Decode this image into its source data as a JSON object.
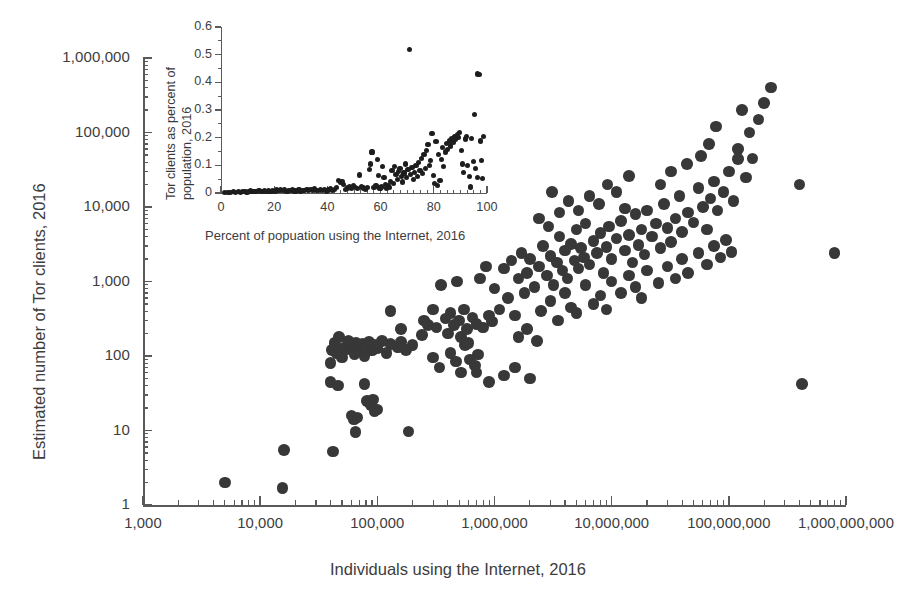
{
  "chart_data": {
    "type": "scatter",
    "title": "",
    "xlabel": "Individuals using the Internet, 2016",
    "ylabel": "Estimated number of Tor clients, 2016",
    "xscale": "log",
    "yscale": "log",
    "xlim": [
      1000,
      1000000000
    ],
    "ylim": [
      1,
      1000000
    ],
    "grid": false,
    "legend": "none",
    "x_tick_labels": [
      "1,000",
      "10,000",
      "100,000",
      "1,000,000",
      "10,000,000",
      "100,000,000",
      "1,000,000,000"
    ],
    "y_tick_labels": [
      "1",
      "10",
      "100",
      "1,000",
      "10,000",
      "100,000",
      "1,000,000"
    ],
    "marker_color": "#383838",
    "points": [
      [
        5000,
        2
      ],
      [
        15500,
        1.7
      ],
      [
        16000,
        5.5
      ],
      [
        42000,
        5.2
      ],
      [
        65000,
        9.5
      ],
      [
        185000,
        9.7
      ],
      [
        40000,
        80
      ],
      [
        41000,
        120
      ],
      [
        43000,
        150
      ],
      [
        45000,
        110
      ],
      [
        47000,
        180
      ],
      [
        50000,
        95
      ],
      [
        52000,
        130
      ],
      [
        55000,
        125
      ],
      [
        57000,
        160
      ],
      [
        60000,
        140
      ],
      [
        62000,
        120
      ],
      [
        64000,
        105
      ],
      [
        66000,
        150
      ],
      [
        70000,
        135
      ],
      [
        72000,
        115
      ],
      [
        75000,
        145
      ],
      [
        78000,
        100
      ],
      [
        80000,
        130
      ],
      [
        85000,
        155
      ],
      [
        90000,
        118
      ],
      [
        95000,
        140
      ],
      [
        100000,
        128
      ],
      [
        110000,
        160
      ],
      [
        120000,
        110
      ],
      [
        130000,
        145
      ],
      [
        150000,
        130
      ],
      [
        160000,
        155
      ],
      [
        175000,
        120
      ],
      [
        40000,
        45
      ],
      [
        46000,
        40
      ],
      [
        78000,
        42
      ],
      [
        82000,
        25
      ],
      [
        88000,
        22
      ],
      [
        92000,
        26
      ],
      [
        95000,
        18
      ],
      [
        100000,
        19
      ],
      [
        250000,
        300
      ],
      [
        270000,
        260
      ],
      [
        300000,
        420
      ],
      [
        320000,
        240
      ],
      [
        350000,
        900
      ],
      [
        380000,
        320
      ],
      [
        400000,
        200
      ],
      [
        420000,
        380
      ],
      [
        450000,
        260
      ],
      [
        480000,
        1000
      ],
      [
        500000,
        300
      ],
      [
        520000,
        180
      ],
      [
        550000,
        420
      ],
      [
        580000,
        230
      ],
      [
        600000,
        150
      ],
      [
        650000,
        330
      ],
      [
        700000,
        270
      ],
      [
        750000,
        1100
      ],
      [
        800000,
        240
      ],
      [
        850000,
        1600
      ],
      [
        900000,
        350
      ],
      [
        950000,
        290
      ],
      [
        1000000,
        800
      ],
      [
        1100000,
        420
      ],
      [
        1200000,
        1500
      ],
      [
        1300000,
        600
      ],
      [
        1400000,
        1900
      ],
      [
        1500000,
        350
      ],
      [
        1600000,
        1100
      ],
      [
        1700000,
        2400
      ],
      [
        1800000,
        700
      ],
      [
        1900000,
        1300
      ],
      [
        2000000,
        2000
      ],
      [
        2200000,
        850
      ],
      [
        2400000,
        1600
      ],
      [
        2600000,
        3000
      ],
      [
        2800000,
        1200
      ],
      [
        3000000,
        2200
      ],
      [
        3200000,
        900
      ],
      [
        3400000,
        1800
      ],
      [
        3600000,
        4000
      ],
      [
        3800000,
        1400
      ],
      [
        4000000,
        2600
      ],
      [
        4200000,
        1100
      ],
      [
        4500000,
        3200
      ],
      [
        4800000,
        1900
      ],
      [
        5000000,
        5000
      ],
      [
        5200000,
        1500
      ],
      [
        5500000,
        2800
      ],
      [
        5800000,
        2100
      ],
      [
        6000000,
        6000
      ],
      [
        6500000,
        1700
      ],
      [
        7000000,
        3500
      ],
      [
        7500000,
        2400
      ],
      [
        8000000,
        4500
      ],
      [
        8500000,
        1300
      ],
      [
        9000000,
        2900
      ],
      [
        9500000,
        5500
      ],
      [
        10000000,
        2000
      ],
      [
        11000000,
        3800
      ],
      [
        12000000,
        6500
      ],
      [
        13000000,
        2600
      ],
      [
        14000000,
        4200
      ],
      [
        15000000,
        1800
      ],
      [
        16000000,
        8000
      ],
      [
        17000000,
        3100
      ],
      [
        18000000,
        5000
      ],
      [
        19000000,
        2300
      ],
      [
        20000000,
        9000
      ],
      [
        22000000,
        4000
      ],
      [
        24000000,
        6000
      ],
      [
        26000000,
        2800
      ],
      [
        28000000,
        11000
      ],
      [
        30000000,
        5200
      ],
      [
        32000000,
        3400
      ],
      [
        35000000,
        7000
      ],
      [
        38000000,
        14000
      ],
      [
        40000000,
        4600
      ],
      [
        45000000,
        8500
      ],
      [
        50000000,
        6200
      ],
      [
        55000000,
        18000
      ],
      [
        60000000,
        10000
      ],
      [
        65000000,
        5000
      ],
      [
        70000000,
        13000
      ],
      [
        75000000,
        22000
      ],
      [
        80000000,
        9000
      ],
      [
        90000000,
        16000
      ],
      [
        100000000,
        30000
      ],
      [
        110000000,
        12000
      ],
      [
        120000000,
        60000
      ],
      [
        130000000,
        200000
      ],
      [
        140000000,
        25000
      ],
      [
        150000000,
        100000
      ],
      [
        160000000,
        45000
      ],
      [
        180000000,
        150000
      ],
      [
        200000000,
        250000
      ],
      [
        230000000,
        400000
      ],
      [
        120000000,
        44000
      ],
      [
        400000000,
        20000
      ],
      [
        420000000,
        42
      ],
      [
        800000000,
        2400
      ],
      [
        60000,
        16
      ],
      [
        63000,
        14
      ],
      [
        68000,
        15
      ],
      [
        300000,
        95
      ],
      [
        340000,
        70
      ],
      [
        420000,
        110
      ],
      [
        470000,
        85
      ],
      [
        520000,
        60
      ],
      [
        560000,
        140
      ],
      [
        620000,
        90
      ],
      [
        680000,
        75
      ],
      [
        720000,
        105
      ],
      [
        2500000,
        400
      ],
      [
        3000000,
        550
      ],
      [
        3500000,
        300
      ],
      [
        4000000,
        700
      ],
      [
        4500000,
        450
      ],
      [
        5000000,
        380
      ],
      [
        6000000,
        900
      ],
      [
        7000000,
        500
      ],
      [
        8000000,
        650
      ],
      [
        9000000,
        420
      ],
      [
        10000000,
        1000
      ],
      [
        12000000,
        700
      ],
      [
        14000000,
        1200
      ],
      [
        16000000,
        850
      ],
      [
        18000000,
        600
      ],
      [
        20000000,
        1400
      ],
      [
        25000000,
        950
      ],
      [
        30000000,
        1600
      ],
      [
        35000000,
        1100
      ],
      [
        40000000,
        2000
      ],
      [
        45000000,
        1300
      ],
      [
        55000000,
        2400
      ],
      [
        65000000,
        1700
      ],
      [
        75000000,
        3000
      ],
      [
        85000000,
        2100
      ],
      [
        95000000,
        3600
      ],
      [
        105000000,
        2500
      ],
      [
        1600000,
        180
      ],
      [
        1900000,
        230
      ],
      [
        2300000,
        160
      ],
      [
        700000,
        60
      ],
      [
        900000,
        45
      ],
      [
        1200000,
        55
      ],
      [
        1500000,
        70
      ],
      [
        2000000,
        50
      ],
      [
        130000,
        400
      ],
      [
        160000,
        230
      ],
      [
        200000,
        140
      ],
      [
        240000,
        190
      ],
      [
        6500000,
        14000
      ],
      [
        7800000,
        11000
      ],
      [
        9200000,
        20000
      ],
      [
        11000000,
        16000
      ],
      [
        13000000,
        9500
      ],
      [
        2400000,
        7000
      ],
      [
        2900000,
        5500
      ],
      [
        3600000,
        8500
      ],
      [
        4300000,
        12000
      ],
      [
        5200000,
        9000
      ],
      [
        3100000,
        16000
      ],
      [
        14000000,
        26000
      ],
      [
        26000000,
        20000
      ],
      [
        32000000,
        30000
      ],
      [
        44000000,
        38000
      ],
      [
        58000000,
        48000
      ],
      [
        68000000,
        70000
      ],
      [
        78000000,
        120000
      ]
    ]
  },
  "inset_chart_data": {
    "type": "scatter",
    "xlabel": "Percent of popuation using the Internet, 2016",
    "ylabel_lines": [
      "Tor clients as percent of",
      "population, 2016"
    ],
    "xlim": [
      0,
      100
    ],
    "ylim": [
      0,
      0.6
    ],
    "x_tick_labels": [
      "0",
      "20",
      "40",
      "60",
      "80",
      "100"
    ],
    "y_tick_labels": [
      "0",
      "0.1",
      "0.2",
      "0.3",
      "0.4",
      "0.5",
      "0.6"
    ],
    "grid": false,
    "marker_color": "#1d1d1d",
    "points": [
      [
        1.2,
        0.002
      ],
      [
        2.5,
        0.003
      ],
      [
        3.4,
        0.002
      ],
      [
        4.8,
        0.004
      ],
      [
        5.6,
        0.003
      ],
      [
        6.5,
        0.005
      ],
      [
        7.3,
        0.003
      ],
      [
        8.1,
        0.004
      ],
      [
        9.0,
        0.006
      ],
      [
        9.8,
        0.003
      ],
      [
        10.5,
        0.005
      ],
      [
        11.2,
        0.007
      ],
      [
        12.0,
        0.004
      ],
      [
        12.8,
        0.006
      ],
      [
        13.5,
        0.005
      ],
      [
        14.3,
        0.008
      ],
      [
        15.0,
        0.004
      ],
      [
        15.8,
        0.006
      ],
      [
        16.5,
        0.009
      ],
      [
        17.2,
        0.005
      ],
      [
        18.0,
        0.007
      ],
      [
        18.8,
        0.004
      ],
      [
        19.5,
        0.01
      ],
      [
        20.3,
        0.006
      ],
      [
        21.0,
        0.013
      ],
      [
        21.8,
        0.008
      ],
      [
        22.5,
        0.014
      ],
      [
        23.2,
        0.009
      ],
      [
        24.0,
        0.011
      ],
      [
        24.8,
        0.006
      ],
      [
        25.5,
        0.01
      ],
      [
        26.3,
        0.008
      ],
      [
        27.0,
        0.012
      ],
      [
        27.8,
        0.007
      ],
      [
        28.5,
        0.009
      ],
      [
        29.3,
        0.011
      ],
      [
        30.0,
        0.006
      ],
      [
        30.8,
        0.01
      ],
      [
        31.5,
        0.008
      ],
      [
        32.3,
        0.012
      ],
      [
        33.0,
        0.009
      ],
      [
        33.8,
        0.014
      ],
      [
        34.5,
        0.011
      ],
      [
        35.3,
        0.016
      ],
      [
        36.0,
        0.01
      ],
      [
        36.8,
        0.008
      ],
      [
        37.5,
        0.012
      ],
      [
        38.3,
        0.009
      ],
      [
        39.0,
        0.014
      ],
      [
        39.8,
        0.007
      ],
      [
        40.5,
        0.011
      ],
      [
        41.3,
        0.016
      ],
      [
        42.0,
        0.009
      ],
      [
        42.8,
        0.013
      ],
      [
        43.5,
        0.02
      ],
      [
        44.3,
        0.045
      ],
      [
        45.0,
        0.038
      ],
      [
        45.5,
        0.042
      ],
      [
        46.2,
        0.03
      ],
      [
        46.8,
        0.012
      ],
      [
        47.5,
        0.018
      ],
      [
        48.3,
        0.022
      ],
      [
        49.0,
        0.015
      ],
      [
        49.8,
        0.028
      ],
      [
        50.5,
        0.02
      ],
      [
        51.3,
        0.016
      ],
      [
        52.0,
        0.065
      ],
      [
        52.8,
        0.022
      ],
      [
        53.5,
        0.018
      ],
      [
        54.3,
        0.014
      ],
      [
        55.0,
        0.021
      ],
      [
        55.8,
        0.085
      ],
      [
        56.2,
        0.105
      ],
      [
        56.8,
        0.148
      ],
      [
        57.5,
        0.02
      ],
      [
        58.3,
        0.025
      ],
      [
        58.8,
        0.12
      ],
      [
        59.3,
        0.063
      ],
      [
        59.8,
        0.018
      ],
      [
        60.3,
        0.022
      ],
      [
        60.8,
        0.095
      ],
      [
        61.3,
        0.055
      ],
      [
        61.8,
        0.03
      ],
      [
        62.3,
        0.018
      ],
      [
        62.8,
        0.025
      ],
      [
        63.3,
        0.02
      ],
      [
        63.8,
        0.042
      ],
      [
        64.3,
        0.08
      ],
      [
        64.8,
        0.035
      ],
      [
        65.3,
        0.095
      ],
      [
        65.8,
        0.068
      ],
      [
        66.3,
        0.05
      ],
      [
        66.8,
        0.078
      ],
      [
        67.3,
        0.088
      ],
      [
        67.8,
        0.06
      ],
      [
        68.3,
        0.04
      ],
      [
        68.8,
        0.072
      ],
      [
        69.3,
        0.105
      ],
      [
        69.8,
        0.055
      ],
      [
        70.3,
        0.085
      ],
      [
        70.8,
        0.52
      ],
      [
        71.3,
        0.068
      ],
      [
        71.8,
        0.092
      ],
      [
        72.3,
        0.048
      ],
      [
        72.8,
        0.075
      ],
      [
        73.3,
        0.098
      ],
      [
        73.8,
        0.06
      ],
      [
        74.3,
        0.11
      ],
      [
        74.8,
        0.082
      ],
      [
        75.3,
        0.125
      ],
      [
        75.8,
        0.07
      ],
      [
        76.3,
        0.138
      ],
      [
        76.8,
        0.09
      ],
      [
        77.3,
        0.155
      ],
      [
        77.8,
        0.175
      ],
      [
        78.3,
        0.1
      ],
      [
        78.8,
        0.118
      ],
      [
        79.3,
        0.215
      ],
      [
        79.8,
        0.062
      ],
      [
        80.3,
        0.035
      ],
      [
        80.8,
        0.185
      ],
      [
        81.3,
        0.028
      ],
      [
        81.8,
        0.14
      ],
      [
        82.3,
        0.045
      ],
      [
        82.8,
        0.12
      ],
      [
        83.3,
        0.165
      ],
      [
        83.8,
        0.095
      ],
      [
        84.3,
        0.148
      ],
      [
        84.8,
        0.178
      ],
      [
        85.3,
        0.158
      ],
      [
        85.8,
        0.188
      ],
      [
        86.3,
        0.17
      ],
      [
        86.8,
        0.195
      ],
      [
        87.3,
        0.182
      ],
      [
        87.8,
        0.205
      ],
      [
        88.3,
        0.192
      ],
      [
        88.8,
        0.212
      ],
      [
        89.3,
        0.2
      ],
      [
        89.8,
        0.218
      ],
      [
        90.3,
        0.155
      ],
      [
        90.8,
        0.105
      ],
      [
        91.3,
        0.075
      ],
      [
        91.8,
        0.195
      ],
      [
        92.3,
        0.205
      ],
      [
        92.8,
        0.1
      ],
      [
        93.3,
        0.06
      ],
      [
        93.8,
        0.022
      ],
      [
        94.3,
        0.198
      ],
      [
        94.8,
        0.115
      ],
      [
        95.3,
        0.285
      ],
      [
        95.8,
        0.09
      ],
      [
        96.3,
        0.055
      ],
      [
        96.5,
        0.43
      ],
      [
        97.2,
        0.428
      ],
      [
        97.5,
        0.188
      ],
      [
        98.0,
        0.118
      ],
      [
        98.4,
        0.052
      ],
      [
        98.8,
        0.205
      ]
    ]
  }
}
